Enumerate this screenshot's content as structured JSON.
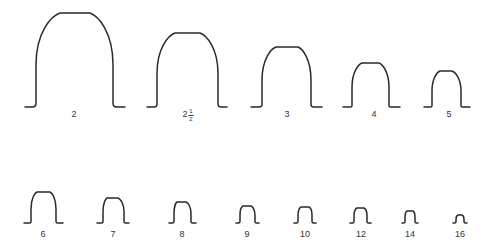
{
  "diagram": {
    "stroke_color": "#2a2a2a",
    "teeth": [
      {
        "label": "2",
        "whole": "2",
        "num": "",
        "den": "",
        "x0": 25,
        "xw1": 36,
        "xt1": 60,
        "xt2": 90,
        "xw2": 113,
        "x1": 125,
        "base": 107,
        "top": 13,
        "lx": 74,
        "ly": 110
      },
      {
        "label": "2 1/2",
        "whole": "2",
        "num": "1",
        "den": "2",
        "x0": 147,
        "xw1": 157,
        "xt1": 175,
        "xt2": 200,
        "xw2": 218,
        "x1": 227,
        "base": 107,
        "top": 33,
        "lx": 188,
        "ly": 108
      },
      {
        "label": "3",
        "whole": "3",
        "num": "",
        "den": "",
        "x0": 251,
        "xw1": 262,
        "xt1": 276,
        "xt2": 298,
        "xw2": 311,
        "x1": 322,
        "base": 107,
        "top": 47,
        "lx": 287,
        "ly": 110
      },
      {
        "label": "4",
        "whole": "4",
        "num": "",
        "den": "",
        "x0": 343,
        "xw1": 352,
        "xt1": 362,
        "xt2": 379,
        "xw2": 389,
        "x1": 400,
        "base": 107,
        "top": 63,
        "lx": 374,
        "ly": 110
      },
      {
        "label": "5",
        "whole": "5",
        "num": "",
        "den": "",
        "x0": 424,
        "xw1": 432,
        "xt1": 440,
        "xt2": 452,
        "xw2": 461,
        "x1": 470,
        "base": 107,
        "top": 71,
        "lx": 449,
        "ly": 110
      },
      {
        "label": "6",
        "whole": "6",
        "num": "",
        "den": "",
        "x0": 24,
        "xw1": 31,
        "xt1": 37,
        "xt2": 50,
        "xw2": 56,
        "x1": 63,
        "base": 223,
        "top": 192,
        "lx": 43,
        "ly": 230
      },
      {
        "label": "7",
        "whole": "7",
        "num": "",
        "den": "",
        "x0": 97,
        "xw1": 103,
        "xt1": 107,
        "xt2": 118,
        "xw2": 124,
        "x1": 129,
        "base": 223,
        "top": 198,
        "lx": 113,
        "ly": 230
      },
      {
        "label": "8",
        "whole": "8",
        "num": "",
        "den": "",
        "x0": 169,
        "xw1": 174,
        "xt1": 177,
        "xt2": 186,
        "xw2": 191,
        "x1": 196,
        "base": 223,
        "top": 202,
        "lx": 182,
        "ly": 230
      },
      {
        "label": "9",
        "whole": "9",
        "num": "",
        "den": "",
        "x0": 236,
        "xw1": 240,
        "xt1": 243,
        "xt2": 251,
        "xw2": 255,
        "x1": 259,
        "base": 223,
        "top": 206,
        "lx": 247,
        "ly": 230
      },
      {
        "label": "10",
        "whole": "10",
        "num": "",
        "den": "",
        "x0": 294,
        "xw1": 298,
        "xt1": 301,
        "xt2": 309,
        "xw2": 312,
        "x1": 316,
        "base": 223,
        "top": 207,
        "lx": 305,
        "ly": 230
      },
      {
        "label": "12",
        "whole": "12",
        "num": "",
        "den": "",
        "x0": 350,
        "xw1": 354,
        "xt1": 357,
        "xt2": 364,
        "xw2": 367,
        "x1": 371,
        "base": 223,
        "top": 208,
        "lx": 361,
        "ly": 230
      },
      {
        "label": "14",
        "whole": "14",
        "num": "",
        "den": "",
        "x0": 402,
        "xw1": 405,
        "xt1": 407,
        "xt2": 413,
        "xw2": 415,
        "x1": 418,
        "base": 223,
        "top": 211,
        "lx": 410,
        "ly": 230
      },
      {
        "label": "16",
        "whole": "16",
        "num": "",
        "den": "",
        "x0": 453,
        "xw1": 456,
        "xt1": 458,
        "xt2": 462,
        "xw2": 464,
        "x1": 467,
        "base": 223,
        "top": 215,
        "lx": 460,
        "ly": 230
      }
    ]
  }
}
